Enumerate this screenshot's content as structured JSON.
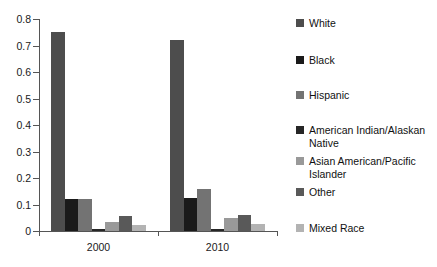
{
  "chart_data": {
    "type": "bar",
    "title": "",
    "subtitle": "",
    "xlabel": "",
    "ylabel": "",
    "categories": [
      "2000",
      "2010"
    ],
    "ylim": [
      0,
      0.8
    ],
    "ytick_labels": [
      "0",
      "0.1",
      "0.2",
      "0.3",
      "0.4",
      "0.5",
      "0.6",
      "0.7",
      "0.8"
    ],
    "ytick_values": [
      0,
      0.1,
      0.2,
      0.3,
      0.4,
      0.5,
      0.6,
      0.7,
      0.8
    ],
    "grid": false,
    "legend_position": "right",
    "series": [
      {
        "name": "White",
        "values": [
          0.75,
          0.72
        ],
        "color": "#4d4d4d"
      },
      {
        "name": "Black",
        "values": [
          0.12,
          0.125
        ],
        "color": "#1a1a1a"
      },
      {
        "name": "Hispanic",
        "values": [
          0.12,
          0.16
        ],
        "color": "#737373"
      },
      {
        "name": "American Indian/Alaskan Native",
        "values": [
          0.008,
          0.008
        ],
        "color": "#262626"
      },
      {
        "name": "Asian American/Pacific Islander",
        "values": [
          0.035,
          0.05
        ],
        "color": "#999999"
      },
      {
        "name": "Other",
        "values": [
          0.055,
          0.06
        ],
        "color": "#595959"
      },
      {
        "name": "Mixed Race",
        "values": [
          0.022,
          0.025
        ],
        "color": "#b3b3b3"
      }
    ]
  },
  "axis": {
    "axis_color": "#555555",
    "background": "#ffffff"
  }
}
